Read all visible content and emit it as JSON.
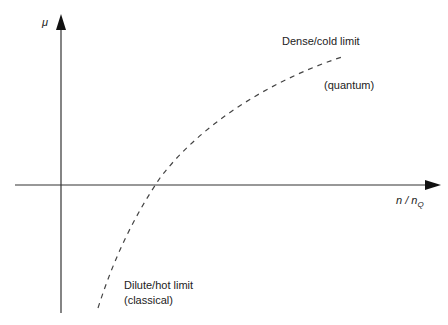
{
  "diagram": {
    "y_axis": {
      "label": "μ",
      "color": "#333333"
    },
    "x_axis": {
      "label_main": "n / n",
      "label_subscript": "Q",
      "color": "#333333"
    },
    "curve": {
      "style": "dashed",
      "color": "#444444",
      "description": "chemical potential vs n/nQ"
    },
    "annotations": {
      "dense_limit": "Dense/cold limit",
      "quantum": "(quantum)",
      "dilute_limit": "Dilute/hot limit",
      "classical": "(classical)"
    }
  }
}
